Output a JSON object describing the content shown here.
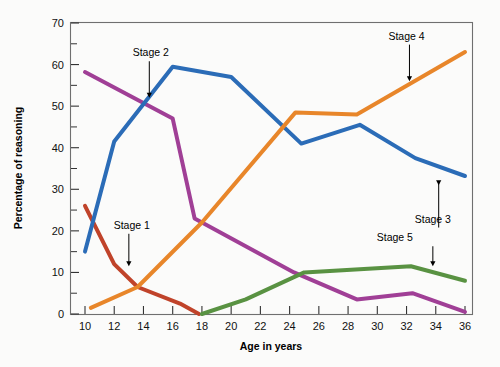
{
  "chart_data": {
    "type": "line",
    "title": "",
    "xlabel": "Age in years",
    "ylabel": "Percentage of reasoning",
    "xlim": [
      9,
      37
    ],
    "ylim": [
      0,
      70
    ],
    "grid": false,
    "legend_position": "inline-annotations",
    "xticks": [
      10,
      12,
      14,
      16,
      18,
      20,
      22,
      24,
      26,
      28,
      30,
      32,
      34,
      36
    ],
    "xtick_labels": [
      "10",
      "12",
      "14",
      "16",
      "18",
      "20",
      "22",
      "24",
      "26",
      "28",
      "30",
      "32",
      "34",
      "36"
    ],
    "yticks": [
      0,
      10,
      20,
      30,
      40,
      50,
      60,
      70
    ],
    "ytick_labels": [
      "0",
      "10",
      "20",
      "30",
      "40",
      "50",
      "60",
      "70"
    ],
    "yticks_minor": [
      5,
      15,
      25,
      35,
      45,
      55,
      65
    ],
    "series": [
      {
        "name": "Stage 1",
        "color": "#c0432a",
        "label_x": 13.2,
        "label_y": 20.5,
        "arrow_to_x": 13.0,
        "arrow_to_y": 11.5,
        "x": [
          10.0,
          12.0,
          13.6,
          16.5,
          17.8
        ],
        "values": [
          26.0,
          12.0,
          6.5,
          2.5,
          0.0
        ]
      },
      {
        "name": "Stage 2",
        "color": "#a03f96",
        "label_x": 14.5,
        "label_y": 62.0,
        "arrow_to_x": 14.4,
        "arrow_to_y": 52.0,
        "x": [
          10.0,
          16.0,
          17.5,
          24.3,
          28.6,
          32.4,
          36.0
        ],
        "values": [
          58.2,
          47.0,
          23.0,
          10.0,
          3.5,
          5.0,
          0.5
        ]
      },
      {
        "name": "Stage 3",
        "color": "#2b6cb7",
        "label_x": 33.8,
        "label_y": 22.0,
        "arrow_to_x": 34.2,
        "arrow_to_y": 31.0,
        "x": [
          10.0,
          12.0,
          16.0,
          20.0,
          24.8,
          28.8,
          32.6,
          36.0
        ],
        "values": [
          15.0,
          41.5,
          59.5,
          57.0,
          41.0,
          45.5,
          37.5,
          33.2
        ]
      },
      {
        "name": "Stage 4",
        "color": "#e8862a",
        "label_x": 32.0,
        "label_y": 66.0,
        "arrow_to_x": 32.2,
        "arrow_to_y": 56.0,
        "x": [
          10.4,
          13.6,
          18.0,
          24.4,
          28.6,
          36.0
        ],
        "values": [
          1.5,
          6.5,
          22.0,
          48.5,
          48.0,
          63.0
        ]
      },
      {
        "name": "Stage 5",
        "color": "#599242",
        "label_x": 31.2,
        "label_y": 17.5,
        "arrow_to_x": 33.8,
        "arrow_to_y": 11.5,
        "x": [
          18.0,
          21.0,
          25.0,
          32.3,
          36.0
        ],
        "values": [
          0.0,
          3.5,
          10.0,
          11.5,
          8.0
        ]
      }
    ]
  }
}
